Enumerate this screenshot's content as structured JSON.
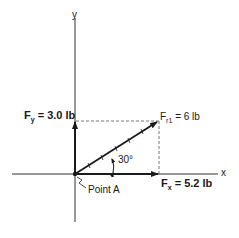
{
  "diagram": {
    "type": "force-vector-resolution",
    "axes": {
      "x_label": "x",
      "y_label": "y"
    },
    "origin_label": "Point A",
    "resultant": {
      "symbol": "F",
      "subscript": "r1",
      "value_text": "= 6 lb",
      "magnitude": 6,
      "unit": "lb"
    },
    "angle_label": "30°",
    "angle_deg": 30,
    "components": {
      "fx": {
        "symbol": "F",
        "subscript": "x",
        "value_text": "= 5.2 lb",
        "magnitude": 5.2
      },
      "fy": {
        "symbol": "F",
        "subscript": "y",
        "value_text": "= 3.0 lb",
        "magnitude": 3.0
      }
    },
    "colors": {
      "line": "#1a1a1a",
      "dashed": "#555555"
    }
  }
}
